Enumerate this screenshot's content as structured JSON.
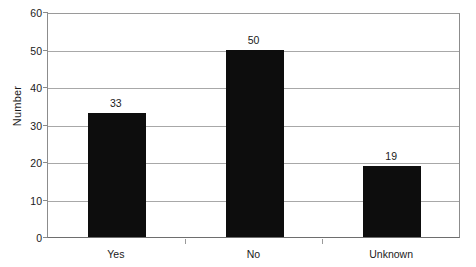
{
  "chart_data": {
    "type": "bar",
    "title": "",
    "subtitle": "",
    "xlabel": "",
    "ylabel": "Number",
    "categories": [
      "Yes",
      "No",
      "Unknown"
    ],
    "values": [
      33,
      50,
      19
    ],
    "value_labels": [
      "33",
      "50",
      "19"
    ],
    "ylim": [
      0,
      60
    ],
    "y_tick_step": 10,
    "y_ticks": [
      0,
      10,
      20,
      30,
      40,
      50,
      60
    ],
    "y_tick_labels": [
      "0",
      "10",
      "20",
      "30",
      "40",
      "50",
      "60"
    ],
    "grid": true,
    "grid_axis": "y",
    "legend": false,
    "legend_position": "none",
    "bar_color": "#0d0d0d",
    "grid_color": "#a8a8a8",
    "axis_color": "#6e6e6e",
    "text_color": "#1a1a1a",
    "background_color": "#ffffff"
  }
}
